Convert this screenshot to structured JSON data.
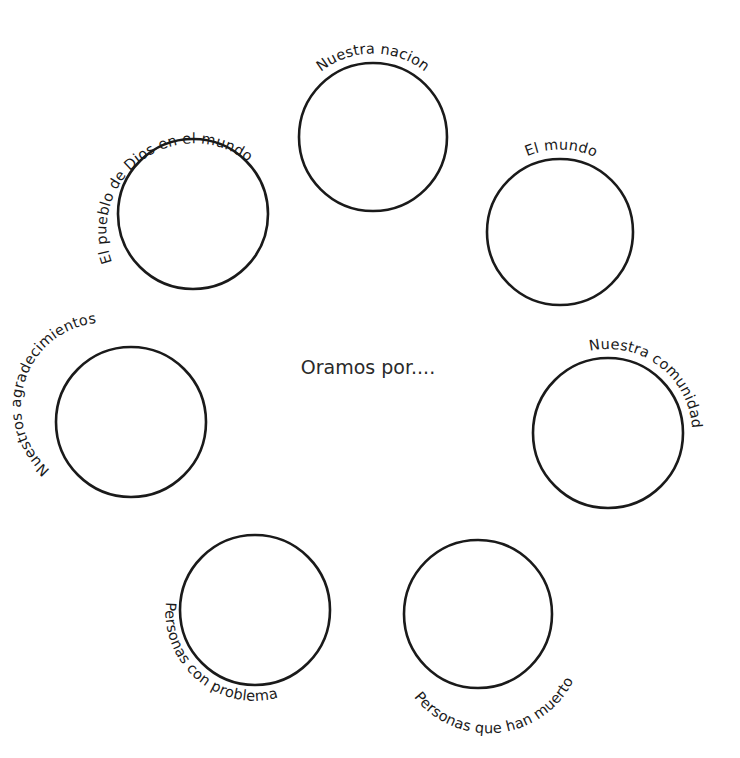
{
  "center_title": "Oramos por....",
  "circles": [
    {
      "id": "nuestra-nacion",
      "label": "Nuestra nacion",
      "cx": 373,
      "cy": 137,
      "r": 74
    },
    {
      "id": "el-pueblo-de-dios",
      "label": "El pueblo de Dios en el mundo",
      "cx": 193,
      "cy": 214,
      "r": 75
    },
    {
      "id": "el-mundo",
      "label": "El mundo",
      "cx": 560,
      "cy": 232,
      "r": 73
    },
    {
      "id": "nuestros-agradecimientos",
      "label": "Nuestros agradecimientos",
      "cx": 131,
      "cy": 422,
      "r": 75
    },
    {
      "id": "nuestra-comunidad",
      "label": "Nuestra comunidad",
      "cx": 608,
      "cy": 433,
      "r": 75
    },
    {
      "id": "personas-con-problemas",
      "label": "Personas con problemas",
      "cx": 255,
      "cy": 610,
      "r": 75
    },
    {
      "id": "personas-que-han-muerto",
      "label": "Personas que han muerto",
      "cx": 478,
      "cy": 614,
      "r": 74
    }
  ],
  "colors": {
    "background": "#ffffff",
    "stroke": "#1a1a1a",
    "text": "#1a1a1a"
  }
}
